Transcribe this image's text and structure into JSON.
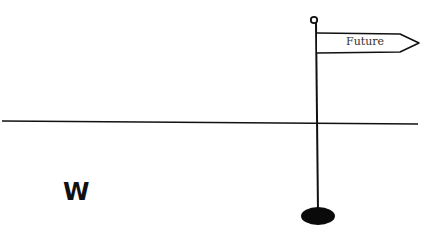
{
  "diagram": {
    "flag": {
      "label": "Future"
    },
    "marker": {
      "label": "W"
    },
    "colors": {
      "ink": "#111111",
      "background": "#ffffff",
      "text": "#333333"
    }
  }
}
